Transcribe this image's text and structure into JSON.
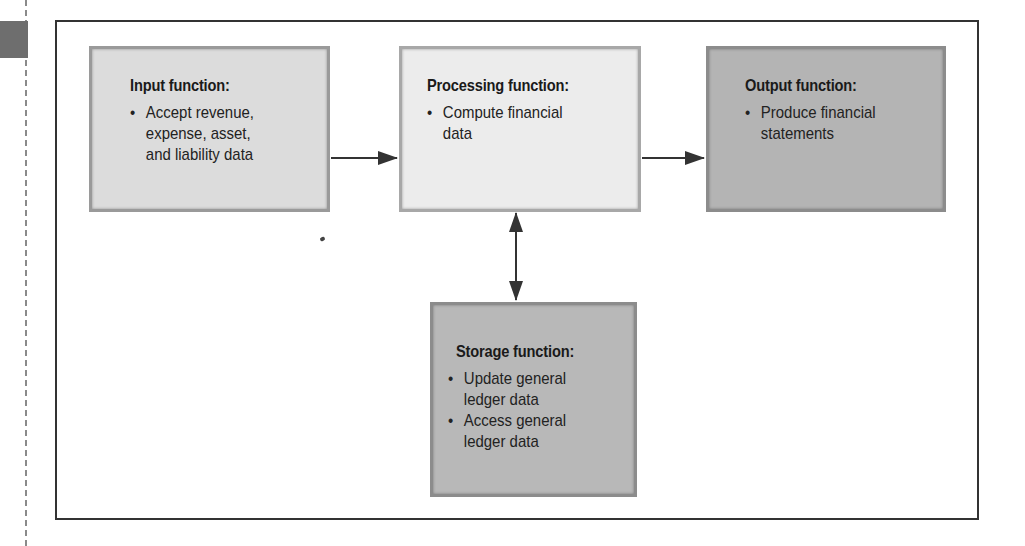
{
  "diagram": {
    "type": "flow",
    "nodes": [
      {
        "id": "input",
        "title": "Input function:",
        "bullets": [
          "Accept revenue,\nexpense, asset,\nand liability data"
        ],
        "fill": "#dcdcdc"
      },
      {
        "id": "processing",
        "title": "Processing function:",
        "bullets": [
          "Compute financial\ndata"
        ],
        "fill": "#ececec"
      },
      {
        "id": "output",
        "title": "Output function:",
        "bullets": [
          "Produce financial\nstatements"
        ],
        "fill": "#b4b4b4"
      },
      {
        "id": "storage",
        "title": "Storage function:",
        "bullets": [
          "Update general\nledger data",
          "Access general\nledger data"
        ],
        "fill": "#b8b8b8"
      }
    ],
    "edges": [
      {
        "from": "input",
        "to": "processing",
        "direction": "forward"
      },
      {
        "from": "processing",
        "to": "output",
        "direction": "forward"
      },
      {
        "from": "processing",
        "to": "storage",
        "direction": "bidirectional"
      }
    ]
  }
}
